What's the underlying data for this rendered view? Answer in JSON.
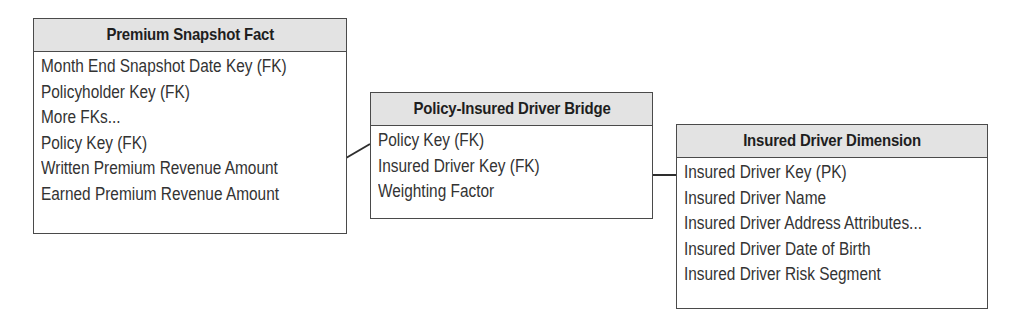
{
  "diagram": {
    "colors": {
      "border": "#4a4a4a",
      "header_fill": "#e3e3e3",
      "text": "#333333",
      "background": "#ffffff"
    },
    "tables": [
      {
        "id": "premium-snapshot-fact",
        "title": "Premium Snapshot Fact",
        "rows": [
          "Month End Snapshot Date Key (FK)",
          "Policyholder Key (FK)",
          "More FKs...",
          "Policy Key (FK)",
          "Written Premium Revenue Amount",
          "Earned Premium Revenue Amount"
        ]
      },
      {
        "id": "policy-insured-driver-bridge",
        "title": "Policy-Insured Driver Bridge",
        "rows": [
          "Policy Key (FK)",
          "Insured Driver Key (FK)",
          "Weighting Factor"
        ]
      },
      {
        "id": "insured-driver-dimension",
        "title": "Insured Driver Dimension",
        "rows": [
          "Insured Driver Key (PK)",
          "Insured Driver Name",
          "Insured Driver Address Attributes...",
          "Insured Driver Date of Birth",
          "Insured Driver Risk Segment"
        ]
      }
    ],
    "relationships": [
      {
        "from": "premium-snapshot-fact",
        "from_field": "Policy Key (FK)",
        "to": "policy-insured-driver-bridge",
        "to_field": "Policy Key (FK)"
      },
      {
        "from": "policy-insured-driver-bridge",
        "from_field": "Insured Driver Key (FK)",
        "to": "insured-driver-dimension",
        "to_field": "Insured Driver Key (PK)"
      }
    ]
  }
}
